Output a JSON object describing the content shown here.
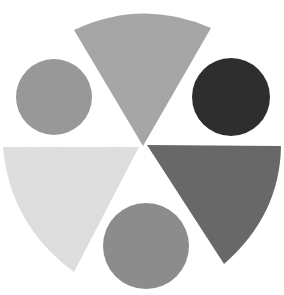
{
  "canvas": {
    "width": 284,
    "height": 295,
    "background": "#ffffff"
  },
  "wedges": [
    {
      "name": "top-wedge",
      "fill": "#a9a9a9",
      "path": "M 143 146 L 74 30 Q 142 -2 211 28 Z"
    },
    {
      "name": "left-wedge",
      "fill": "#e2e2e2",
      "path": "M 139 147 L 3 147 Q 10 225 74 272 Z"
    },
    {
      "name": "right-wedge",
      "fill": "#6a6a6a",
      "path": "M 147 145 L 281 146 Q 280 215 224 264 Z"
    }
  ],
  "circles": [
    {
      "name": "left-circle",
      "cx": 54,
      "cy": 97,
      "r": 38,
      "fill": "#9b9b9b"
    },
    {
      "name": "right-circle",
      "cx": 231,
      "cy": 97,
      "r": 39,
      "fill": "#2e2e2e"
    },
    {
      "name": "bottom-circle",
      "cx": 146,
      "cy": 246,
      "r": 43,
      "fill": "#8f8f8f"
    }
  ]
}
